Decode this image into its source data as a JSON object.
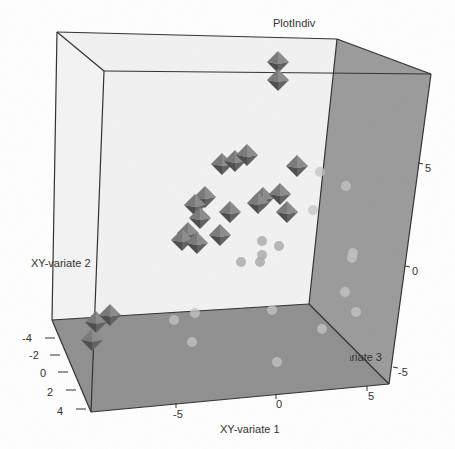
{
  "chart_data": {
    "type": "scatter3d",
    "title": "PlotIndiv",
    "xlabel": "XY-variate 1",
    "ylabel": "XY-variate 2",
    "zlabel": "XY-variate 3",
    "x_ticks": [
      "-5",
      "0",
      "5"
    ],
    "y_ticks": [
      "5",
      "0",
      "-5"
    ],
    "z_ticks": [
      "-4",
      "-2",
      "0",
      "2",
      "4"
    ],
    "colors": {
      "floor": "#8f8f8f",
      "right_wall": "#9a9a9a",
      "back_wall": "#f2f2f2",
      "edges": "#333333",
      "octahedron": "#6e6e6e",
      "sphere": "#bdbdbd"
    },
    "series": [
      {
        "name": "group-octahedra",
        "shape": "octahedron",
        "screen_points": [
          [
            278,
            62
          ],
          [
            278,
            80
          ],
          [
            222,
            164
          ],
          [
            235,
            161
          ],
          [
            247,
            155
          ],
          [
            297,
            166
          ],
          [
            263,
            198
          ],
          [
            280,
            194
          ],
          [
            287,
            212
          ],
          [
            258,
            203
          ],
          [
            205,
            197
          ],
          [
            195,
            205
          ],
          [
            200,
            218
          ],
          [
            230,
            212
          ],
          [
            188,
            233
          ],
          [
            182,
            240
          ],
          [
            197,
            243
          ],
          [
            220,
            235
          ],
          [
            96,
            322
          ],
          [
            110,
            315
          ],
          [
            92,
            340
          ]
        ]
      },
      {
        "name": "group-spheres",
        "shape": "sphere",
        "screen_points": [
          [
            262,
            241
          ],
          [
            279,
            246
          ],
          [
            241,
            262
          ],
          [
            260,
            262
          ],
          [
            262,
            255
          ],
          [
            346,
            186
          ],
          [
            352,
            258
          ],
          [
            353,
            253
          ],
          [
            345,
            292
          ],
          [
            320,
            172
          ],
          [
            313,
            210
          ],
          [
            195,
            313
          ],
          [
            174,
            320
          ],
          [
            192,
            342
          ],
          [
            272,
            310
          ],
          [
            277,
            362
          ],
          [
            322,
            329
          ],
          [
            356,
            312
          ]
        ]
      }
    ]
  }
}
